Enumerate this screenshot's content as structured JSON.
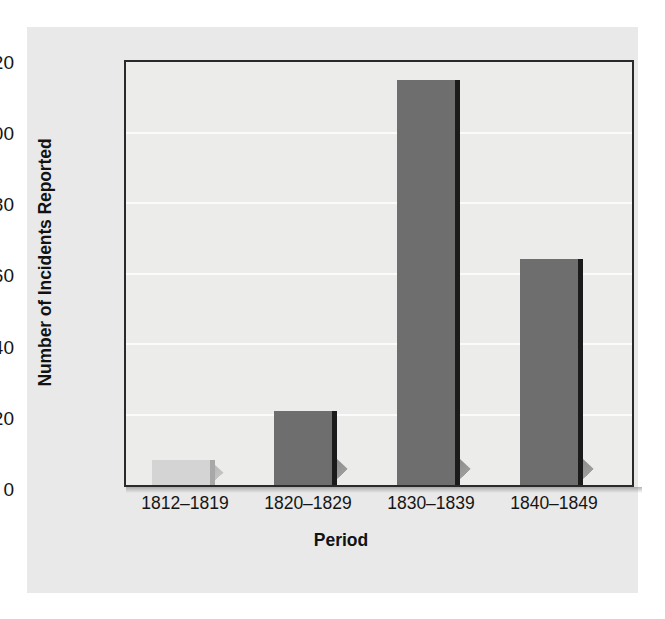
{
  "chart_data": {
    "type": "bar",
    "title": "",
    "xlabel": "Period",
    "ylabel": "Number of Incidents Reported",
    "categories": [
      "1812–1819",
      "1820–1829",
      "1830–1839",
      "1840–1849"
    ],
    "values": [
      7,
      21,
      115,
      64
    ],
    "ylim": [
      0,
      120
    ],
    "yticks": [
      0,
      20,
      40,
      60,
      80,
      100,
      120
    ],
    "ytick_labels": [
      "0",
      "20",
      "40",
      "60",
      "80",
      "100",
      "120"
    ],
    "grid": "horizontal",
    "legend": "none",
    "bar_colors": [
      "#d4d4d4",
      "#6e6e6e",
      "#6e6e6e",
      "#6e6e6e"
    ],
    "bar_edge_colors": [
      "#a8a8a8",
      "#1b1b1b",
      "#1b1b1b",
      "#1b1b1b"
    ],
    "series": [
      {
        "name": "Number of Incidents Reported",
        "values": [
          7,
          21,
          115,
          64
        ]
      }
    ]
  },
  "figure": {
    "panel_background": "#e9e9e9",
    "plot_background": "#ececeb",
    "frame_color": "#2a2a2a",
    "gridline_color": "#fbfbfb",
    "text_color": "#151515"
  }
}
